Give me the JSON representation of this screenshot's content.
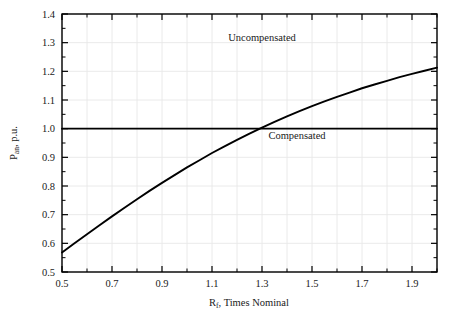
{
  "chart_data": {
    "type": "line",
    "title": "",
    "xlabel": "R f , Times Nominal",
    "xlabel_base": "R",
    "xlabel_sub": "f",
    "xlabel_rest": ", Times Nominal",
    "ylabel": "P an , p.u.",
    "ylabel_base": "P",
    "ylabel_sub": "an",
    "ylabel_rest": ", p.u.",
    "xlim": [
      0.5,
      2.0
    ],
    "ylim": [
      0.5,
      1.4
    ],
    "grid": true,
    "legend_position": "inline-annotation",
    "xticks": [
      0.5,
      0.7,
      0.9,
      1.1,
      1.3,
      1.5,
      1.7,
      1.9
    ],
    "xtick_labels": [
      "0.5",
      "0.7",
      "0.9",
      "1.1",
      "1.3",
      "1.5",
      "1.7",
      "1.9"
    ],
    "xminor_ticks": [
      0.6,
      0.8,
      1.0,
      1.2,
      1.4,
      1.6,
      1.8,
      2.0
    ],
    "yticks": [
      0.5,
      0.6,
      0.7,
      0.8,
      0.9,
      1.0,
      1.1,
      1.2,
      1.3,
      1.4
    ],
    "ytick_labels": [
      "0.5",
      "0.6",
      "0.7",
      "0.8",
      "0.9",
      "1.0",
      "1.1",
      "1.2",
      "1.3",
      "1.4"
    ],
    "series": [
      {
        "name": "Uncompensated",
        "label_text": "Uncompensated",
        "label_x": 1.3,
        "label_y": 1.305,
        "color": "#000000",
        "x": [
          0.5,
          0.55,
          0.6,
          0.65,
          0.7,
          0.75,
          0.8,
          0.85,
          0.9,
          0.95,
          1.0,
          1.05,
          1.1,
          1.15,
          1.2,
          1.25,
          1.3,
          1.35,
          1.4,
          1.45,
          1.5,
          1.55,
          1.6,
          1.65,
          1.7,
          1.75,
          1.8,
          1.85,
          1.9,
          1.95,
          2.0
        ],
        "values": [
          0.568,
          0.6,
          0.632,
          0.663,
          0.694,
          0.724,
          0.754,
          0.783,
          0.811,
          0.838,
          0.865,
          0.89,
          0.915,
          0.938,
          0.961,
          0.983,
          1.004,
          1.024,
          1.043,
          1.061,
          1.079,
          1.095,
          1.111,
          1.126,
          1.141,
          1.154,
          1.167,
          1.18,
          1.191,
          1.202,
          1.213
        ]
      },
      {
        "name": "Compensated",
        "label_text": "Compensated",
        "label_x": 1.44,
        "label_y": 0.965,
        "color": "#000000",
        "x": [
          0.5,
          2.0
        ],
        "values": [
          1.0,
          1.0
        ]
      }
    ]
  },
  "axes_style": {
    "frame_color": "#000000",
    "grid_color": "#e8e8e8",
    "background": "#ffffff",
    "curve_color": "#000000"
  }
}
